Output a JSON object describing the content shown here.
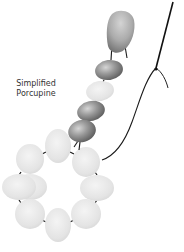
{
  "caption": {
    "line1": "Simplified",
    "line2": "Porcupine"
  },
  "colors": {
    "background": "#ffffff",
    "thread": "#1a1a1a",
    "dark_bead": "#8a8a8a",
    "light_bead": "#e6e6e6",
    "drop_bead": "#a8a8a8",
    "text": "#333333"
  },
  "elements": {
    "drop_bead": {
      "label": "drop-bead"
    },
    "strand_beads": [
      {
        "label": "dark-bead",
        "cx": 108,
        "cy": 70,
        "rx": 14,
        "ry": 10,
        "shade": "dark"
      },
      {
        "label": "light-bead",
        "cx": 100,
        "cy": 91,
        "rx": 13,
        "ry": 10,
        "shade": "light"
      },
      {
        "label": "dark-bead",
        "cx": 91,
        "cy": 111,
        "rx": 14,
        "ry": 10,
        "shade": "dark"
      },
      {
        "label": "dark-bead",
        "cx": 82,
        "cy": 131,
        "rx": 14,
        "ry": 11,
        "shade": "dark"
      }
    ],
    "ring_beads": [
      {
        "label": "ring-bead",
        "cx": 58,
        "cy": 149,
        "rx": 13,
        "ry": 17
      },
      {
        "label": "ring-bead",
        "cx": 86,
        "cy": 159,
        "rx": 14,
        "ry": 15
      },
      {
        "label": "ring-bead",
        "cx": 98,
        "cy": 187,
        "rx": 17,
        "ry": 13
      },
      {
        "label": "ring-bead",
        "cx": 86,
        "cy": 215,
        "rx": 14,
        "ry": 15
      },
      {
        "label": "ring-bead",
        "cx": 58,
        "cy": 225,
        "rx": 13,
        "ry": 17
      },
      {
        "label": "ring-bead",
        "cx": 30,
        "cy": 215,
        "rx": 14,
        "ry": 15
      },
      {
        "label": "ring-bead",
        "cx": 19,
        "cy": 187,
        "rx": 17,
        "ry": 13
      },
      {
        "label": "ring-bead",
        "cx": 30,
        "cy": 159,
        "rx": 14,
        "ry": 15
      }
    ]
  }
}
